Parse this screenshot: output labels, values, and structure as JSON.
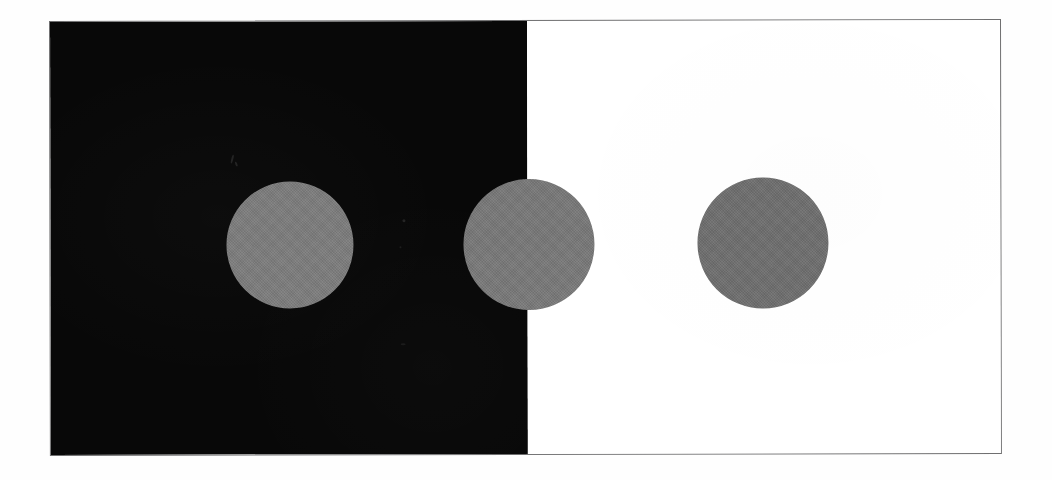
{
  "figure": {
    "kind": "simultaneous-lightness-contrast-illustration",
    "alt_text": "Three identical gray discs: one on a black field, one straddling the black-white border, one on a white field",
    "canvas": {
      "width_px": 1052,
      "height_px": 480,
      "background_color": "#fefefe"
    },
    "plate": {
      "left_px": 49,
      "top_px": 21,
      "width_px": 952,
      "height_px": 435,
      "border_color": "#6f6f70",
      "border_width_px": 1,
      "rotation_deg": -0.12
    },
    "panels": [
      {
        "name": "dark-field",
        "label": "black background",
        "color": "#080808",
        "width_px": 477,
        "side": "left"
      },
      {
        "name": "light-field",
        "label": "white background",
        "color": "#ffffff",
        "width_px": 474,
        "side": "right"
      }
    ],
    "divider_x_px": 526,
    "discs": [
      {
        "name": "disc-on-black",
        "label": "gray disc on black field",
        "color": "#7d7d7d",
        "center_x_px": 288,
        "center_y_px": 244,
        "diameter_px": 127,
        "background": "black"
      },
      {
        "name": "disc-on-border",
        "label": "gray disc straddling the border",
        "color": "#797979",
        "center_x_px": 527,
        "center_y_px": 244,
        "diameter_px": 131,
        "background": "black-and-white"
      },
      {
        "name": "disc-on-white",
        "label": "gray disc on white field",
        "color": "#6f6f6f",
        "center_x_px": 761,
        "center_y_px": 243,
        "diameter_px": 131,
        "background": "white"
      }
    ],
    "artifacts": [
      {
        "name": "speck-a",
        "x_px": 230,
        "y_px": 154
      },
      {
        "name": "speck-b",
        "x_px": 234,
        "y_px": 161
      },
      {
        "name": "speck-c",
        "x_px": 401,
        "y_px": 219
      },
      {
        "name": "speck-d",
        "x_px": 398,
        "y_px": 246
      },
      {
        "name": "speck-e",
        "x_px": 399,
        "y_px": 343
      }
    ]
  }
}
